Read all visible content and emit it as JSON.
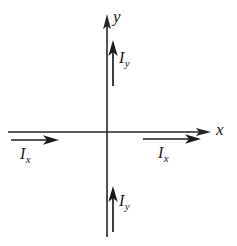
{
  "figure": {
    "background_color": "#ffffff",
    "stroke_color": "#1c1c1c",
    "width": 237,
    "height": 246,
    "origin": {
      "x": 107,
      "y": 132
    }
  },
  "axes": {
    "x_axis": {
      "label": "x",
      "label_position": {
        "x": 216,
        "y": 122
      },
      "start": {
        "x": 8,
        "y": 132
      },
      "end": {
        "x": 211,
        "y": 132
      },
      "arrow": "right"
    },
    "y_axis": {
      "label": "y",
      "label_position": {
        "x": 113,
        "y": 10
      },
      "start": {
        "x": 107,
        "y": 237
      },
      "end": {
        "x": 107,
        "y": 14
      },
      "arrow": "up"
    }
  },
  "vectors": [
    {
      "name": "current-x-left",
      "label_base": "I",
      "label_sub": "x",
      "direction": "right",
      "start": {
        "x": 11,
        "y": 140
      },
      "end": {
        "x": 59,
        "y": 140
      },
      "label_position": {
        "x": 20,
        "y": 146
      }
    },
    {
      "name": "current-x-right",
      "label_base": "I",
      "label_sub": "x",
      "direction": "right",
      "start": {
        "x": 143,
        "y": 139
      },
      "end": {
        "x": 201,
        "y": 139
      },
      "label_position": {
        "x": 158,
        "y": 145
      }
    },
    {
      "name": "current-y-upper",
      "label_base": "I",
      "label_sub": "y",
      "direction": "up",
      "start": {
        "x": 113,
        "y": 86
      },
      "end": {
        "x": 113,
        "y": 40
      },
      "label_position": {
        "x": 119,
        "y": 50
      }
    },
    {
      "name": "current-y-lower",
      "label_base": "I",
      "label_sub": "y",
      "direction": "up",
      "start": {
        "x": 113,
        "y": 232
      },
      "end": {
        "x": 113,
        "y": 186
      },
      "label_position": {
        "x": 119,
        "y": 193
      }
    }
  ]
}
